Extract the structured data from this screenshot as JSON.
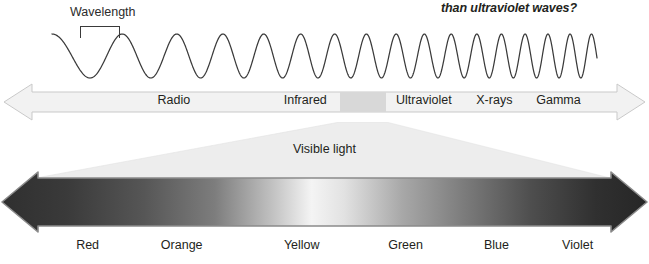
{
  "figure": {
    "caption_fragment": "than ultraviolet waves?",
    "background_color": "#ffffff",
    "text_color": "#231f20"
  },
  "wave": {
    "label": "Wavelength",
    "bracket_name": "wavelength-bracket",
    "stroke_color": "#3a3a3a",
    "description": "Sine wave whose wavelength decreases from left to right"
  },
  "em_band": {
    "arrow_fill": "#f2f2f2",
    "arrow_stroke": "#c9c9c9",
    "visible_block_fill": "#d8d8d8",
    "regions": [
      {
        "label": "Radio",
        "center_pct": 26.5
      },
      {
        "label": "Infrared",
        "center_pct": 47.0
      },
      {
        "label": "Ultraviolet",
        "center_pct": 65.5
      },
      {
        "label": "X-rays",
        "center_pct": 76.5
      },
      {
        "label": "Gamma",
        "center_pct": 86.5
      }
    ]
  },
  "funnel": {
    "label": "Visible light",
    "fill": "#ededed"
  },
  "spectrum": {
    "arrow_outline": "#8a8a8a",
    "colors": [
      {
        "label": "Red",
        "center_pct": 13.5,
        "swatch": "#3b3b3b"
      },
      {
        "label": "Orange",
        "center_pct": 28.0,
        "swatch": "#6e6e6e"
      },
      {
        "label": "Yellow",
        "center_pct": 46.5,
        "swatch": "#e8e8e8"
      },
      {
        "label": "Green",
        "center_pct": 62.5,
        "swatch": "#9a9a9a"
      },
      {
        "label": "Blue",
        "center_pct": 76.5,
        "swatch": "#5a5a5a"
      },
      {
        "label": "Violet",
        "center_pct": 89.0,
        "swatch": "#2e2e2e"
      }
    ],
    "gradient_stops": [
      {
        "pos": 0,
        "color": "#2f2f2f"
      },
      {
        "pos": 10,
        "color": "#3a3a3a"
      },
      {
        "pos": 22,
        "color": "#565656"
      },
      {
        "pos": 33,
        "color": "#7d7d7d"
      },
      {
        "pos": 42,
        "color": "#c2c2c2"
      },
      {
        "pos": 48,
        "color": "#f4f4f4"
      },
      {
        "pos": 53,
        "color": "#e2e2e2"
      },
      {
        "pos": 62,
        "color": "#a8a8a8"
      },
      {
        "pos": 72,
        "color": "#7a7a7a"
      },
      {
        "pos": 82,
        "color": "#4e4e4e"
      },
      {
        "pos": 92,
        "color": "#303030"
      },
      {
        "pos": 100,
        "color": "#262626"
      }
    ]
  }
}
